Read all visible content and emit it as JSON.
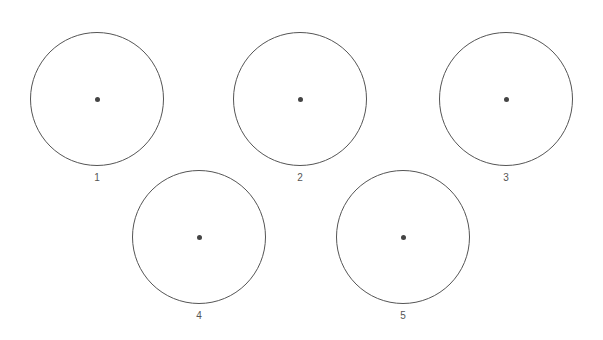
{
  "figure": {
    "circles": [
      {
        "label": "1",
        "cx": 97,
        "cy": 99,
        "r": 67
      },
      {
        "label": "2",
        "cx": 300,
        "cy": 99,
        "r": 67
      },
      {
        "label": "3",
        "cx": 506,
        "cy": 99,
        "r": 67
      },
      {
        "label": "4",
        "cx": 199,
        "cy": 237,
        "r": 67
      },
      {
        "label": "5",
        "cx": 403,
        "cy": 237,
        "r": 67
      }
    ]
  },
  "labels": [
    "1",
    "2",
    "3",
    "4",
    "5"
  ]
}
